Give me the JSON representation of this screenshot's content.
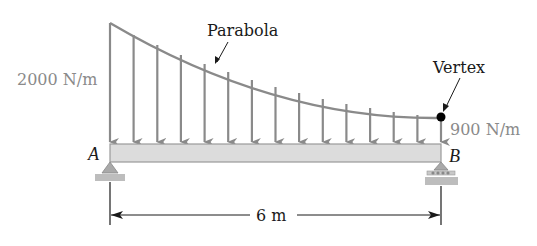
{
  "diagram": {
    "labels": {
      "curve": "Parabola",
      "vertex": "Vertex",
      "load_left": "2000 N/m",
      "load_right": "900 N/m",
      "support_left": "A",
      "support_right": "B",
      "span": "6 m"
    },
    "load": {
      "left_intensity": 2000,
      "right_intensity": 900,
      "unit": "N/m",
      "shape": "parabolic, vertex at B",
      "arrow_count": 15
    },
    "supports": {
      "A": "pin",
      "B": "roller"
    },
    "colors": {
      "load_gray": "#8a8a8a",
      "beam_fill": "#dcdcdc",
      "beam_stroke": "#9a9a9a",
      "text_dark": "#1a1a1a",
      "vertex_dot": "#000000"
    }
  }
}
